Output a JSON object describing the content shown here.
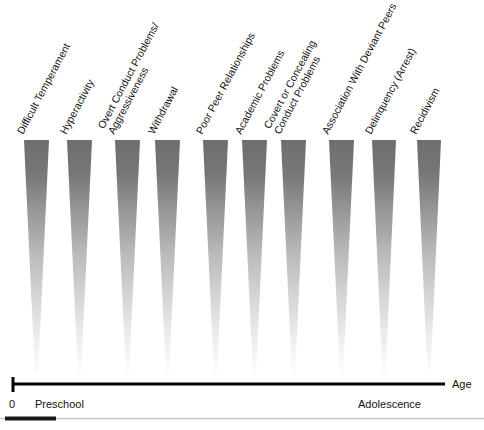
{
  "figure": {
    "background_color": "#ffffff",
    "wedge_color_top": "#6e6e6e",
    "wedge_color_bottom": "#fbfbfb",
    "axis_color": "#000000",
    "label_rotation_degrees": -62
  },
  "axis": {
    "name": "age-axis",
    "label": "Age",
    "origin_label": "0",
    "stages": [
      {
        "label": "Preschool",
        "x": 35
      },
      {
        "label": "Adolescence",
        "x": 358
      }
    ],
    "line_start_x": 12,
    "line_end_x": 445,
    "line_y": 384
  },
  "behaviors": [
    {
      "id": "difficult-temperament",
      "label": "Difficult Temperament",
      "label_lines": [
        "Difficult Temperament"
      ],
      "x_left": 24,
      "x_right": 49
    },
    {
      "id": "hyperactivity",
      "label": "Hyperactivity",
      "label_lines": [
        "Hyperactivity"
      ],
      "x_left": 67,
      "x_right": 92
    },
    {
      "id": "overt-conduct-problems-aggressiveness",
      "label": "Overt Conduct Problems/ Aggressiveness",
      "label_lines": [
        "Overt Conduct Problems/",
        "Aggressiveness"
      ],
      "x_left": 115,
      "x_right": 140
    },
    {
      "id": "withdrawal",
      "label": "Withdrawal",
      "label_lines": [
        "Withdrawal"
      ],
      "x_left": 155,
      "x_right": 180
    },
    {
      "id": "poor-peer-relationships",
      "label": "Poor Peer Relationships",
      "label_lines": [
        "Poor Peer Relationships"
      ],
      "x_left": 203,
      "x_right": 228
    },
    {
      "id": "academic-problems",
      "label": "Academic Problems",
      "label_lines": [
        "Academic Problems"
      ],
      "x_left": 242,
      "x_right": 267
    },
    {
      "id": "covert-or-concealing-conduct-problems",
      "label": "Covert or Concealing Conduct Problems",
      "label_lines": [
        "Covert or Concealing",
        "Conduct Problems"
      ],
      "x_left": 281,
      "x_right": 306
    },
    {
      "id": "association-with-deviant-peers",
      "label": "Association With Deviant Peers",
      "label_lines": [
        "Association With Deviant Peers"
      ],
      "x_left": 329,
      "x_right": 354
    },
    {
      "id": "delinquency-arrest",
      "label": "Delinquency (Arrest)",
      "label_lines": [
        "Delinquency (Arrest)"
      ],
      "x_left": 372,
      "x_right": 396
    },
    {
      "id": "recidivism",
      "label": "Recidivism",
      "label_lines": [
        "Recidivism"
      ],
      "x_left": 417,
      "x_right": 441
    }
  ],
  "wedge_geometry": {
    "top_y": 140,
    "bottom_y": 373,
    "tip_half_width": 1.6
  },
  "footer_rule": {
    "name": "bottom-rule",
    "y": 418,
    "dark_segment_start_x": 5,
    "dark_segment_end_x": 56,
    "light_end_x": 484
  }
}
